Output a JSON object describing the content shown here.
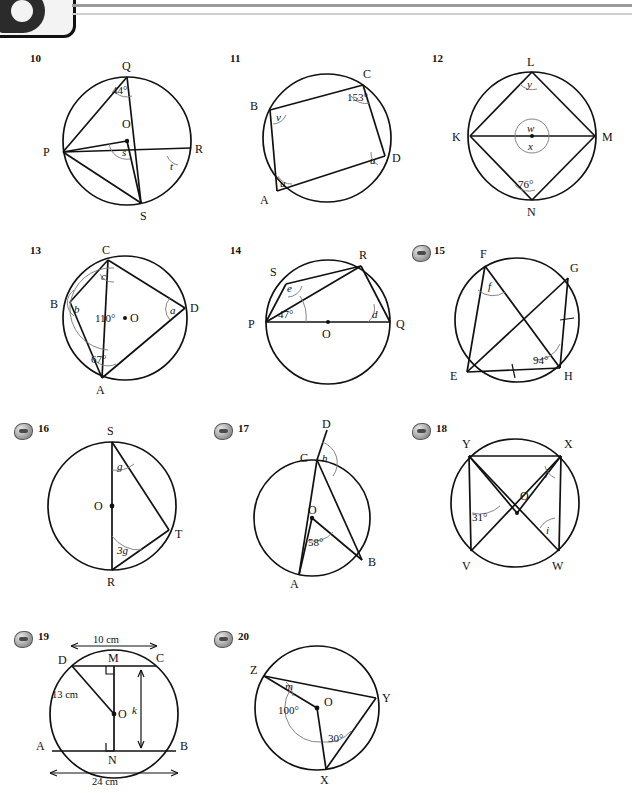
{
  "page": {
    "header_icon": "page-tab-glyph",
    "figure_count": 11
  },
  "figures": [
    {
      "number": "10",
      "has_globe_icon": false,
      "vertices": [
        "Q",
        "O",
        "P",
        "R",
        "S"
      ],
      "angles": [
        "44°",
        "s",
        "t"
      ],
      "description": "Circle centre O with points P, Q, R, S; angle PQS = 44 degrees, angle s at centre, angle t at R"
    },
    {
      "number": "11",
      "has_globe_icon": false,
      "vertices": [
        "C",
        "B",
        "D",
        "A"
      ],
      "angles": [
        "153°",
        "v",
        "u",
        "u"
      ],
      "description": "Cyclic quadrilateral ABCD with angle C = 153 degrees, angle B = v, angle D = u, angle A = u"
    },
    {
      "number": "12",
      "has_globe_icon": false,
      "vertices": [
        "L",
        "K",
        "M",
        "N"
      ],
      "angles": [
        "y",
        "w",
        "x",
        "76°"
      ],
      "description": "Circle with K, L, M, N; angle L = y, centre angles w and x, angle N = 76 degrees"
    },
    {
      "number": "13",
      "has_globe_icon": false,
      "vertices": [
        "C",
        "B",
        "O",
        "D",
        "A"
      ],
      "angles": [
        "c",
        "b",
        "110°",
        "a",
        "67°"
      ],
      "description": "Circle centre O with A, B, C, D; angle c at C, angle b at B, centre angle 110 degrees, angle a at D, angle 67 degrees at A"
    },
    {
      "number": "14",
      "has_globe_icon": false,
      "vertices": [
        "R",
        "S",
        "P",
        "O",
        "Q"
      ],
      "angles": [
        "e",
        "47°",
        "d"
      ],
      "description": "Circle centre O, PQ diameter, R and S on circle; angle e at S, 47 degrees at P, angle d at Q"
    },
    {
      "number": "15",
      "has_globe_icon": true,
      "vertices": [
        "F",
        "G",
        "E",
        "H"
      ],
      "angles": [
        "f",
        "94°"
      ],
      "marks": [
        "tick on GH",
        "tick on EH"
      ],
      "description": "Cyclic quadrilateral EFGH with diagonals; angle f at F, 94 degrees at H, GH = EH"
    },
    {
      "number": "16",
      "has_globe_icon": true,
      "vertices": [
        "S",
        "O",
        "T",
        "R"
      ],
      "angles": [
        "g",
        "3g"
      ],
      "description": "Circle centre O, SR diameter, T on circle; angle g at S, angle 3g at R"
    },
    {
      "number": "17",
      "has_globe_icon": true,
      "vertices": [
        "D",
        "C",
        "O",
        "A",
        "B"
      ],
      "angles": [
        "h",
        "58°"
      ],
      "description": "Circle centre O with A, B, C; D on CA extended; angle h at C, centre angle AOB = 58 degrees"
    },
    {
      "number": "18",
      "has_globe_icon": true,
      "vertices": [
        "Y",
        "X",
        "O",
        "V",
        "W"
      ],
      "angles": [
        "j",
        "31°",
        "i"
      ],
      "description": "Circle centre O with V, W, X, Y; angle j at X, 31 degrees at V, angle i at W"
    },
    {
      "number": "19",
      "has_globe_icon": true,
      "vertices": [
        "D",
        "M",
        "C",
        "O",
        "A",
        "N",
        "B"
      ],
      "angles": [],
      "dimensions": [
        "10 cm",
        "13 cm",
        "k",
        "24 cm"
      ],
      "right_angles": [
        "M",
        "N"
      ],
      "description": "Circle centre O with parallel chords DC = 10 cm and AB = 24 cm, radius OD = 13 cm, distance k between chords, perpendicular feet M and N"
    },
    {
      "number": "20",
      "has_globe_icon": true,
      "vertices": [
        "Z",
        "O",
        "Y",
        "X"
      ],
      "angles": [
        "m",
        "100°",
        "30°"
      ],
      "description": "Circle centre O with X, Y, Z; angle m at Z, centre angle ZOX = 100 degrees, angle OXY = 30 degrees"
    }
  ]
}
